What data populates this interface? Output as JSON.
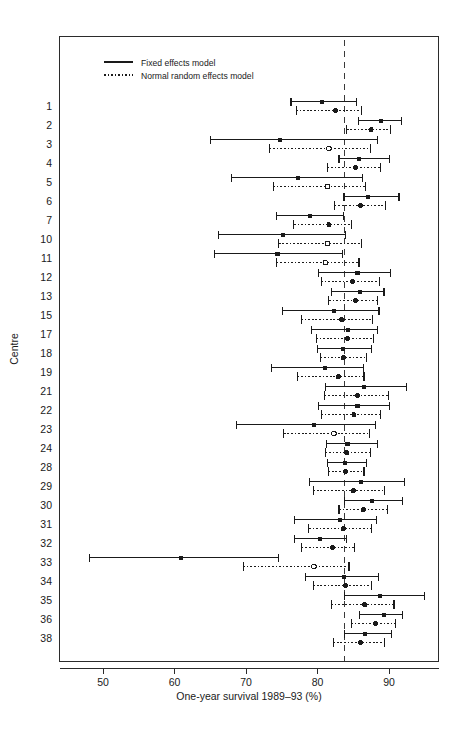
{
  "chart_data": {
    "type": "scatter",
    "title": "",
    "xlabel": "One-year survival 1989–93 (%)",
    "ylabel": "Centre",
    "xlim": [
      45.6,
      96.6
    ],
    "xticks": [
      50,
      60,
      70,
      80,
      90
    ],
    "xtick_labels": [
      "50",
      "60",
      "70",
      "80",
      "90"
    ],
    "grid": false,
    "legend_position": "top-left",
    "legend": [
      {
        "label": "Fixed effects model",
        "style": "solid",
        "marker": "filled-square"
      },
      {
        "label": "Normal random effects model",
        "style": "dotted",
        "marker": "open-circle"
      }
    ],
    "reference_line": {
      "value": 83.8,
      "style": "dashed",
      "label": ""
    },
    "categories": [
      "1",
      "2",
      "3",
      "4",
      "5",
      "6",
      "7",
      "10",
      "11",
      "12",
      "13",
      "15",
      "17",
      "18",
      "19",
      "21",
      "22",
      "23",
      "24",
      "28",
      "29",
      "30",
      "31",
      "32",
      "33",
      "34",
      "35",
      "36",
      "38"
    ],
    "series": [
      {
        "name": "Fixed effects model",
        "style": "solid",
        "marker": "filled-square",
        "points": [
          {
            "centre": "1",
            "estimate": 80.6,
            "low": 76.3,
            "high": 85.4
          },
          {
            "centre": "2",
            "estimate": 88.9,
            "low": 85.7,
            "high": 91.8
          },
          {
            "centre": "3",
            "estimate": 74.7,
            "low": 65.0,
            "high": 88.4
          },
          {
            "centre": "4",
            "estimate": 85.8,
            "low": 83.0,
            "high": 90.1
          },
          {
            "centre": "5",
            "estimate": 77.3,
            "low": 68.0,
            "high": 86.3
          },
          {
            "centre": "6",
            "estimate": 87.1,
            "low": 83.7,
            "high": 91.4
          },
          {
            "centre": "7",
            "estimate": 78.9,
            "low": 74.3,
            "high": 83.6
          },
          {
            "centre": "10",
            "estimate": 75.2,
            "low": 66.2,
            "high": 83.9
          },
          {
            "centre": "11",
            "estimate": 74.4,
            "low": 65.6,
            "high": 83.5
          },
          {
            "centre": "12",
            "estimate": 85.6,
            "low": 80.1,
            "high": 90.2
          },
          {
            "centre": "13",
            "estimate": 85.9,
            "low": 81.9,
            "high": 89.3
          },
          {
            "centre": "15",
            "estimate": 82.3,
            "low": 75.1,
            "high": 88.6
          },
          {
            "centre": "17",
            "estimate": 84.3,
            "low": 79.2,
            "high": 88.4
          },
          {
            "centre": "18",
            "estimate": 83.6,
            "low": 80.0,
            "high": 87.5
          },
          {
            "centre": "19",
            "estimate": 81.0,
            "low": 73.6,
            "high": 86.4
          },
          {
            "centre": "21",
            "estimate": 86.5,
            "low": 81.1,
            "high": 92.4
          },
          {
            "centre": "22",
            "estimate": 85.6,
            "low": 80.1,
            "high": 90.1
          },
          {
            "centre": "23",
            "estimate": 79.5,
            "low": 68.7,
            "high": 88.1
          },
          {
            "centre": "24",
            "estimate": 84.2,
            "low": 81.2,
            "high": 88.4
          },
          {
            "centre": "28",
            "estimate": 83.9,
            "low": 81.4,
            "high": 86.8
          },
          {
            "centre": "29",
            "estimate": 86.1,
            "low": 78.9,
            "high": 92.2
          },
          {
            "centre": "30",
            "estimate": 87.6,
            "low": 83.8,
            "high": 91.9
          },
          {
            "centre": "31",
            "estimate": 83.1,
            "low": 76.8,
            "high": 88.3
          },
          {
            "centre": "32",
            "estimate": 80.3,
            "low": 76.8,
            "high": 84.1
          },
          {
            "centre": "33",
            "estimate": 60.9,
            "low": 48.1,
            "high": 74.5
          },
          {
            "centre": "34",
            "estimate": 83.7,
            "low": 78.3,
            "high": 88.5
          },
          {
            "centre": "35",
            "estimate": 88.7,
            "low": 83.8,
            "high": 95.0
          },
          {
            "centre": "36",
            "estimate": 89.3,
            "low": 85.9,
            "high": 91.9
          },
          {
            "centre": "38",
            "estimate": 86.6,
            "low": 83.8,
            "high": 90.4
          }
        ]
      },
      {
        "name": "Normal random effects model",
        "style": "dotted",
        "marker": "open-circle",
        "points": [
          {
            "centre": "1",
            "estimate": 82.5,
            "low": 77.0,
            "high": 86.1
          },
          {
            "centre": "2",
            "estimate": 87.5,
            "low": 84.1,
            "high": 90.2
          },
          {
            "centre": "3",
            "estimate": 81.6,
            "low": 73.3,
            "high": 87.4
          },
          {
            "centre": "4",
            "estimate": 85.3,
            "low": 81.4,
            "high": 88.8
          },
          {
            "centre": "5",
            "estimate": 81.4,
            "low": 73.8,
            "high": 86.7
          },
          {
            "centre": "6",
            "estimate": 86.0,
            "low": 82.4,
            "high": 89.5
          },
          {
            "centre": "7",
            "estimate": 81.6,
            "low": 76.7,
            "high": 84.8
          },
          {
            "centre": "10",
            "estimate": 81.4,
            "low": 74.6,
            "high": 86.1
          },
          {
            "centre": "11",
            "estimate": 81.1,
            "low": 74.3,
            "high": 85.8
          },
          {
            "centre": "12",
            "estimate": 84.9,
            "low": 80.5,
            "high": 88.7
          },
          {
            "centre": "13",
            "estimate": 85.3,
            "low": 81.6,
            "high": 88.4
          },
          {
            "centre": "15",
            "estimate": 83.4,
            "low": 77.7,
            "high": 87.7
          },
          {
            "centre": "17",
            "estimate": 84.2,
            "low": 79.8,
            "high": 87.8
          },
          {
            "centre": "18",
            "estimate": 83.6,
            "low": 80.4,
            "high": 86.9
          },
          {
            "centre": "19",
            "estimate": 82.9,
            "low": 77.2,
            "high": 86.5
          },
          {
            "centre": "21",
            "estimate": 85.6,
            "low": 81.0,
            "high": 89.9
          },
          {
            "centre": "22",
            "estimate": 85.1,
            "low": 80.5,
            "high": 88.8
          },
          {
            "centre": "23",
            "estimate": 82.3,
            "low": 75.3,
            "high": 87.3
          },
          {
            "centre": "24",
            "estimate": 84.1,
            "low": 81.1,
            "high": 87.4
          },
          {
            "centre": "28",
            "estimate": 83.9,
            "low": 81.5,
            "high": 86.5
          },
          {
            "centre": "29",
            "estimate": 85.0,
            "low": 79.4,
            "high": 89.4
          },
          {
            "centre": "30",
            "estimate": 86.4,
            "low": 83.0,
            "high": 89.8
          },
          {
            "centre": "31",
            "estimate": 83.6,
            "low": 78.8,
            "high": 87.5
          },
          {
            "centre": "32",
            "estimate": 82.1,
            "low": 77.8,
            "high": 85.2
          },
          {
            "centre": "33",
            "estimate": 79.5,
            "low": 69.6,
            "high": 84.4
          },
          {
            "centre": "34",
            "estimate": 83.9,
            "low": 79.4,
            "high": 87.6
          },
          {
            "centre": "35",
            "estimate": 86.6,
            "low": 81.9,
            "high": 90.7
          },
          {
            "centre": "36",
            "estimate": 88.1,
            "low": 84.7,
            "high": 90.9
          },
          {
            "centre": "38",
            "estimate": 86.0,
            "low": 82.2,
            "high": 89.4
          }
        ]
      }
    ]
  }
}
